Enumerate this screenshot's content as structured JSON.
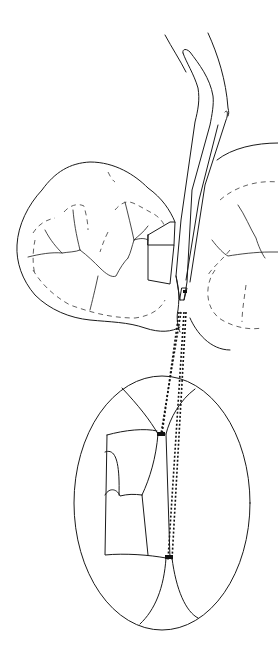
{
  "figure": {
    "type": "line-art illustration",
    "colors": {
      "background": "#ffffff",
      "line": "#1a1a1a"
    },
    "parts": [
      "curved-dental-instrument",
      "left-molar-occlusal",
      "right-molar-occlusal",
      "restoration-block",
      "magnified-inset-ellipse",
      "dotted-projection-lines"
    ]
  }
}
